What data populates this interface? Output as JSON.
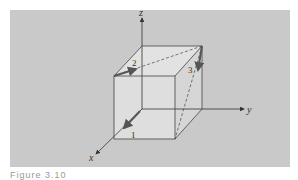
{
  "figure": {
    "axes": {
      "x_label": "x",
      "y_label": "y",
      "z_label": "z"
    },
    "vectors": [
      {
        "id": "1",
        "label": "1"
      },
      {
        "id": "2",
        "label": "2"
      },
      {
        "id": "3",
        "label": "3"
      }
    ],
    "colors": {
      "panel": "#c9c9c9",
      "cube_face": "#dcdcdc",
      "line": "#333333",
      "vector": "#555555"
    },
    "caption": "Figure 3.10"
  }
}
